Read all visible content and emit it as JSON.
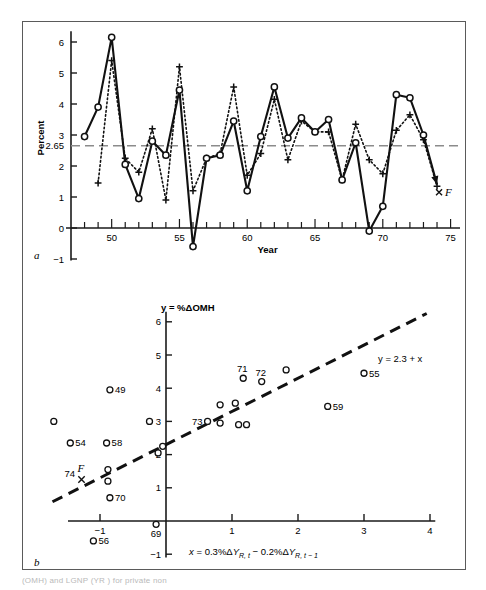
{
  "figure": {
    "panel_a_letter": "a",
    "panel_b_letter": "b",
    "caption_fragment": "(OMH)         and         LGNP (YR ) for private non"
  },
  "panel_a": {
    "ylabel": "Percent",
    "xlabel": "Year",
    "y_ticks": [
      "-1",
      "0",
      "1",
      "2",
      "2.65",
      "3",
      "4",
      "5",
      "6"
    ],
    "x_ticks": [
      "50",
      "55",
      "60",
      "65",
      "70",
      "75"
    ],
    "reference_line_label": "2.65",
    "end_marker_label": "F"
  },
  "panel_b": {
    "ylabel": "y = %ΔOMH",
    "xlabel": "x = 0.3%ΔYR, t − 0.2%ΔYR, t − 1",
    "xlabel_parts": {
      "lead": "x",
      "eq": " = 0.3%Δ",
      "var1": "Y",
      "sub1": "R, t",
      "mid": " − 0.2%Δ",
      "var2": "Y",
      "sub2": "R, t − 1"
    },
    "fit_label": "y = 2.3 + x",
    "y_ticks": [
      "-1",
      "1",
      "2",
      "3",
      "4",
      "5",
      "6"
    ],
    "x_ticks": [
      "-1",
      "1",
      "2",
      "3",
      "4"
    ],
    "forecast_marker": "x",
    "forecast_label_year": "74",
    "forecast_label_f": "F"
  },
  "chart_data": [
    {
      "type": "line",
      "id": "panel-a",
      "title": "",
      "xlabel": "Year",
      "ylabel": "Percent",
      "xlim": [
        47,
        75
      ],
      "ylim": [
        -1,
        6
      ],
      "grid": false,
      "legend": [],
      "reference_lines": [
        {
          "y": 2.65,
          "label": "2.65",
          "style": "dashed",
          "color": "#808080"
        }
      ],
      "annotations": [
        {
          "text": "F",
          "x": 74.6,
          "y": 1.15
        }
      ],
      "series": [
        {
          "name": "actual",
          "marker": "open-circle",
          "line": "solid",
          "x": [
            48,
            49,
            50,
            51,
            52,
            53,
            54,
            55,
            56,
            57,
            58,
            59,
            60,
            61,
            62,
            63,
            64,
            65,
            66,
            67,
            68,
            69,
            70,
            71,
            72,
            73,
            74
          ],
          "values": [
            2.95,
            3.9,
            6.15,
            2.05,
            0.95,
            2.8,
            2.35,
            4.45,
            -0.6,
            2.25,
            2.35,
            3.45,
            1.2,
            2.95,
            4.55,
            2.9,
            3.55,
            3.1,
            3.5,
            1.55,
            2.75,
            -0.1,
            0.7,
            4.3,
            4.2,
            3.0,
            1.4
          ]
        },
        {
          "name": "fitted",
          "marker": "plus",
          "line": "dotted",
          "x": [
            49,
            50,
            51,
            52,
            53,
            54,
            55,
            56,
            57,
            58,
            59,
            60,
            61,
            62,
            63,
            64,
            65,
            66,
            67,
            68,
            69,
            70,
            71,
            72,
            73,
            74
          ],
          "values": [
            1.45,
            5.4,
            2.25,
            1.8,
            3.2,
            0.9,
            5.2,
            1.2,
            2.25,
            2.4,
            4.55,
            1.7,
            2.4,
            4.15,
            2.2,
            3.45,
            3.1,
            3.1,
            1.55,
            3.35,
            2.2,
            1.75,
            3.15,
            3.65,
            2.85,
            1.35
          ]
        }
      ]
    },
    {
      "type": "scatter",
      "id": "panel-b",
      "title": "",
      "xlabel": "x = 0.3%ΔYR, t − 0.2%ΔYR, t − 1",
      "ylabel": "y = %ΔOMH",
      "xlim": [
        -1.7,
        4
      ],
      "ylim": [
        -1,
        6
      ],
      "grid": false,
      "fit_line": {
        "label": "y = 2.3 + x",
        "intercept": 2.3,
        "slope": 1.0,
        "style": "dashed"
      },
      "points": [
        {
          "label": "49",
          "x": -0.85,
          "y": 3.95
        },
        {
          "label": "54",
          "x": -1.45,
          "y": 2.35
        },
        {
          "label": "58",
          "x": -0.9,
          "y": 2.35
        },
        {
          "label": "70",
          "x": -0.85,
          "y": 0.7
        },
        {
          "label": "56",
          "x": -1.1,
          "y": -0.6
        },
        {
          "label": "69",
          "x": -0.15,
          "y": -0.1
        },
        {
          "label": "73",
          "x": 0.63,
          "y": 3.0
        },
        {
          "label": "71",
          "x": 1.17,
          "y": 4.3
        },
        {
          "label": "72",
          "x": 1.45,
          "y": 4.2
        },
        {
          "label": "55",
          "x": 3.0,
          "y": 4.45
        },
        {
          "label": "59",
          "x": 2.45,
          "y": 3.45
        },
        {
          "label": "",
          "x": -0.25,
          "y": 3.0
        },
        {
          "label": "",
          "x": -1.7,
          "y": 3.0
        },
        {
          "label": "",
          "x": -0.12,
          "y": 2.05
        },
        {
          "label": "",
          "x": -0.05,
          "y": 2.25
        },
        {
          "label": "",
          "x": -0.88,
          "y": 1.55
        },
        {
          "label": "",
          "x": -0.88,
          "y": 1.2
        },
        {
          "label": "",
          "x": 0.82,
          "y": 3.5
        },
        {
          "label": "",
          "x": 1.05,
          "y": 3.55
        },
        {
          "label": "",
          "x": 0.82,
          "y": 2.95
        },
        {
          "label": "",
          "x": 1.1,
          "y": 2.9
        },
        {
          "label": "",
          "x": 1.22,
          "y": 2.9
        },
        {
          "label": "",
          "x": 1.82,
          "y": 4.55
        }
      ],
      "forecast_point": {
        "label": "74",
        "sup": "F",
        "x": -1.28,
        "y": 1.25,
        "marker": "x"
      }
    }
  ]
}
